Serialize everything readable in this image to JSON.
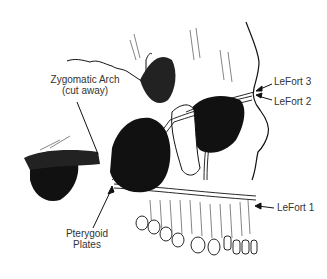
{
  "diagram": {
    "labels": {
      "zygomatic_arch_line1": "Zygomatic Arch",
      "zygomatic_arch_line2": "(cut away)",
      "pterygoid_line1": "Pterygoid",
      "pterygoid_line2": "Plates",
      "lefort3": "LeFort 3",
      "lefort2": "LeFort 2",
      "lefort1": "LeFort 1"
    },
    "colors": {
      "ink": "#111111",
      "label": "#333333",
      "background": "#ffffff"
    }
  }
}
